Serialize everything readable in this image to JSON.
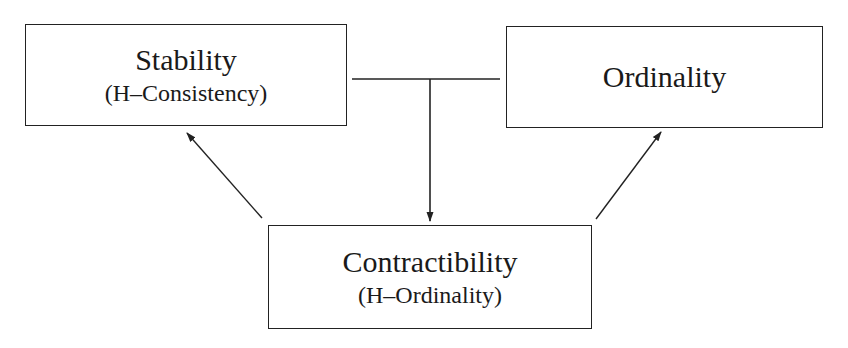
{
  "diagram": {
    "nodes": [
      {
        "id": "stability",
        "title": "Stability",
        "subtitle": "(H–Consistency)"
      },
      {
        "id": "ordinality",
        "title": "Ordinality",
        "subtitle": ""
      },
      {
        "id": "contractibility",
        "title": "Contractibility",
        "subtitle": "(H–Ordinality)"
      }
    ],
    "edges": [
      {
        "from": [
          "stability",
          "ordinality"
        ],
        "to": "contractibility",
        "type": "joined-arrow"
      },
      {
        "from": "contractibility",
        "to": "stability",
        "type": "arrow"
      },
      {
        "from": "contractibility",
        "to": "ordinality",
        "type": "arrow"
      }
    ],
    "colors": {
      "line": "#222222",
      "background": "#ffffff"
    }
  }
}
